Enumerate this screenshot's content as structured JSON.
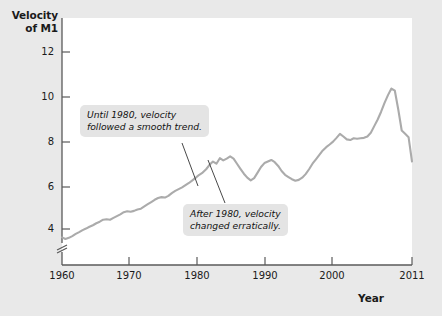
{
  "chart_data": {
    "type": "line",
    "title": "",
    "ylabel": "Velocity of M1",
    "ylabel_line1": "Velocity",
    "ylabel_line2": "of M1",
    "xlabel": "Year",
    "xlim": [
      1960,
      2011
    ],
    "ylim": [
      3.0,
      12.6
    ],
    "grid": false,
    "legend": null,
    "axis_break_y": true,
    "line_color": "#ababab",
    "plot_bg": "#ffffff",
    "figure_bg": "#e9e9e9",
    "yticks": [
      4,
      6,
      8,
      10,
      12
    ],
    "ytick_labels": [
      "4",
      "6",
      "8",
      "10",
      "12"
    ],
    "xticks": [
      1960,
      1970,
      1980,
      1990,
      2000,
      2011
    ],
    "xtick_labels": [
      "1960",
      "1970",
      "1980",
      "1990",
      "2000",
      "2011"
    ],
    "series": [
      {
        "name": "Velocity of M1",
        "x": [
          1960,
          1960.5,
          1961,
          1961.5,
          1962,
          1962.5,
          1963,
          1963.5,
          1964,
          1964.5,
          1965,
          1965.5,
          1966,
          1966.5,
          1967,
          1967.5,
          1968,
          1968.5,
          1969,
          1969.5,
          1970,
          1970.5,
          1971,
          1971.5,
          1972,
          1972.5,
          1973,
          1973.5,
          1974,
          1974.5,
          1975,
          1975.5,
          1976,
          1976.5,
          1977,
          1977.5,
          1978,
          1978.5,
          1979,
          1979.5,
          1980,
          1980.5,
          1981,
          1981.5,
          1982,
          1982.5,
          1983,
          1983.5,
          1984,
          1984.5,
          1985,
          1985.5,
          1986,
          1986.5,
          1987,
          1987.5,
          1988,
          1988.5,
          1989,
          1989.5,
          1990,
          1990.5,
          1991,
          1991.5,
          1992,
          1992.5,
          1993,
          1993.5,
          1994,
          1994.5,
          1995,
          1995.5,
          1996,
          1996.5,
          1997,
          1997.5,
          1998,
          1998.5,
          1999,
          1999.5,
          2000,
          2000.5,
          2001,
          2001.5,
          2002,
          2002.5,
          2003,
          2003.5,
          2004,
          2004.5,
          2005,
          2005.5,
          2006,
          2006.5,
          2007,
          2007.5,
          2008,
          2008.5,
          2009,
          2009.5,
          2010,
          2010.5,
          2011
        ],
        "y": [
          3.62,
          3.55,
          3.6,
          3.68,
          3.78,
          3.86,
          3.95,
          4.02,
          4.1,
          4.17,
          4.26,
          4.33,
          4.42,
          4.44,
          4.42,
          4.5,
          4.58,
          4.66,
          4.76,
          4.8,
          4.78,
          4.82,
          4.88,
          4.92,
          5.02,
          5.12,
          5.22,
          5.32,
          5.4,
          5.44,
          5.42,
          5.5,
          5.62,
          5.72,
          5.8,
          5.88,
          5.98,
          6.08,
          6.2,
          6.32,
          6.45,
          6.55,
          6.7,
          6.9,
          7.05,
          6.95,
          7.2,
          7.1,
          7.18,
          7.28,
          7.18,
          6.95,
          6.72,
          6.5,
          6.32,
          6.2,
          6.3,
          6.55,
          6.8,
          6.98,
          7.05,
          7.12,
          7.02,
          6.85,
          6.62,
          6.45,
          6.35,
          6.25,
          6.18,
          6.22,
          6.32,
          6.48,
          6.7,
          6.95,
          7.15,
          7.35,
          7.55,
          7.7,
          7.82,
          7.95,
          8.12,
          8.3,
          8.18,
          8.05,
          8.02,
          8.1,
          8.08,
          8.1,
          8.12,
          8.18,
          8.35,
          8.65,
          8.95,
          9.3,
          9.7,
          10.05,
          10.35,
          10.25,
          9.4,
          8.45,
          8.3,
          8.15,
          7.05
        ]
      }
    ],
    "annotations": [
      {
        "id": "callout-1",
        "line1": "Until 1980, velocity",
        "line2": "followed a smooth trend.",
        "points_to_year": 1977,
        "points_to_value": 6.0
      },
      {
        "id": "callout-2",
        "line1": "After 1980, velocity",
        "line2": "changed erratically.",
        "points_to_year": 1982,
        "points_to_value": 7.05
      }
    ]
  }
}
